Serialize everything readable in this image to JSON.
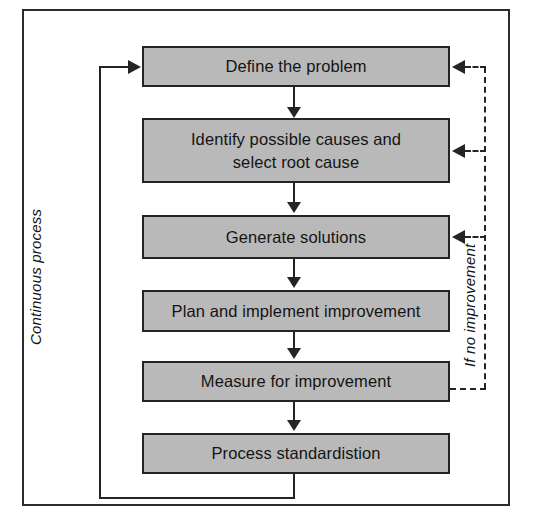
{
  "diagram": {
    "colors": {
      "node_fill": "#b9b9b9",
      "node_border": "#242424",
      "connector": "#242424",
      "frame_border": "#2b2b2b",
      "background": "#ffffff"
    },
    "nodes": [
      {
        "id": "define-the-problem",
        "label": "Define the problem"
      },
      {
        "id": "identify-causes",
        "label": "Identify possible causes and\nselect root cause"
      },
      {
        "id": "generate-solutions",
        "label": "Generate solutions"
      },
      {
        "id": "plan-and-implement",
        "label": "Plan and implement improvement"
      },
      {
        "id": "measure-for-improvement",
        "label": "Measure for improvement"
      },
      {
        "id": "process-standardistion",
        "label": "Process standardistion"
      }
    ],
    "labels": {
      "continuous_process": "Continuous process",
      "if_no_improvement": "If no improvement"
    },
    "edges": [
      {
        "from": "define-the-problem",
        "to": "identify-causes",
        "style": "solid",
        "arrow": "down"
      },
      {
        "from": "identify-causes",
        "to": "generate-solutions",
        "style": "solid",
        "arrow": "down"
      },
      {
        "from": "generate-solutions",
        "to": "plan-and-implement",
        "style": "solid",
        "arrow": "down"
      },
      {
        "from": "plan-and-implement",
        "to": "measure-for-improvement",
        "style": "solid",
        "arrow": "down"
      },
      {
        "from": "measure-for-improvement",
        "to": "process-standardistion",
        "style": "solid",
        "arrow": "down"
      },
      {
        "from": "process-standardistion",
        "to": "define-the-problem",
        "style": "solid",
        "arrow": "left-up",
        "label": "Continuous process"
      },
      {
        "from": "measure-for-improvement",
        "to": "define-the-problem",
        "style": "dashed",
        "arrow": "left",
        "label": "If no improvement"
      },
      {
        "from": "measure-for-improvement",
        "to": "identify-causes",
        "style": "dashed",
        "arrow": "left",
        "label": "If no improvement"
      },
      {
        "from": "measure-for-improvement",
        "to": "generate-solutions",
        "style": "dashed",
        "arrow": "left",
        "label": "If no improvement"
      }
    ]
  }
}
